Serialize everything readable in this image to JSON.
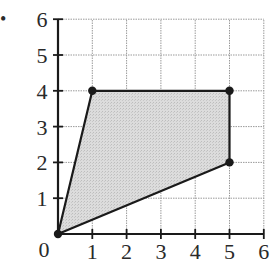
{
  "bullet": "•",
  "chart_data": {
    "type": "scatter",
    "title": "",
    "xlabel": "",
    "ylabel": "",
    "xlim": [
      0,
      6
    ],
    "ylim": [
      0,
      6
    ],
    "grid": true,
    "x_ticks": [
      "0",
      "1",
      "2",
      "3",
      "4",
      "5",
      "6"
    ],
    "y_ticks": [
      "1",
      "2",
      "3",
      "4",
      "5",
      "6"
    ],
    "origin_label": "0",
    "polygon": {
      "name": "shaded quadrilateral",
      "fill": "#d9d9d9",
      "stroke": "#1a1a1a",
      "vertices": [
        {
          "x": 0,
          "y": 0
        },
        {
          "x": 1,
          "y": 4
        },
        {
          "x": 5,
          "y": 4
        },
        {
          "x": 5,
          "y": 2
        }
      ]
    },
    "points": [
      {
        "x": 0,
        "y": 0
      },
      {
        "x": 1,
        "y": 4
      },
      {
        "x": 5,
        "y": 4
      },
      {
        "x": 5,
        "y": 2
      }
    ]
  },
  "colors": {
    "axis": "#1a1a1a",
    "grid": "#9a9a9a",
    "fill": "#d9d9d9",
    "text": "#2a2a2a"
  }
}
